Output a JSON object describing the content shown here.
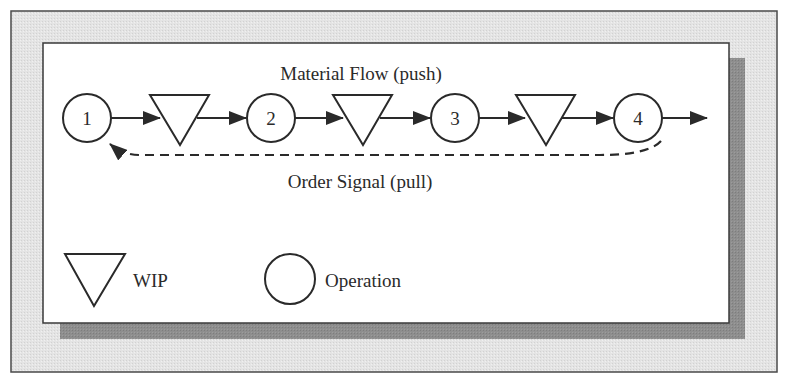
{
  "diagram": {
    "title_top": "Material Flow (push)",
    "title_bottom": "Order Signal (pull)",
    "operations": [
      {
        "label": "1"
      },
      {
        "label": "2"
      },
      {
        "label": "3"
      },
      {
        "label": "4"
      }
    ],
    "wip_buffers": 3,
    "legend": {
      "wip_label": "WIP",
      "operation_label": "Operation"
    }
  },
  "colors": {
    "outer_frame_bg": "#e2e2e2",
    "inner_panel_bg": "#ffffff",
    "shadow": "#8c8c8c",
    "stroke": "#2a2a2a"
  }
}
